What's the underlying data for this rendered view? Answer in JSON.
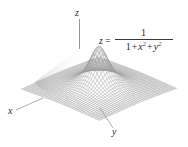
{
  "figure": {
    "name": "surface-plot-figure",
    "background_color": "#ffffff",
    "mesh_color": "#9a9a9a",
    "mesh_shadow_color": "#6e6e6e",
    "axis_color": "#7a7a7a",
    "text_color": "#2b2b2b"
  },
  "axes": {
    "z_label": "z",
    "x_label": "x",
    "y_label": "y"
  },
  "equation": {
    "lhs": "z",
    "relation": "=",
    "numerator": "1",
    "denominator_terms": [
      "1",
      "+",
      "x",
      "2",
      "+",
      "y",
      "2"
    ],
    "denominator_plain": "1 + x² + y²",
    "full_text": "z = 1 / (1 + x² + y²)"
  },
  "chart_data": {
    "type": "surface",
    "title": "",
    "function": "z = 1/(1 + x^2 + y^2)",
    "xlabel": "x",
    "ylabel": "y",
    "zlabel": "z",
    "xlim": [
      -4,
      4
    ],
    "ylim": [
      -4,
      4
    ],
    "zlim": [
      0,
      1
    ],
    "grid": true,
    "mesh_resolution": 40,
    "peak": {
      "x": 0,
      "y": 0,
      "z": 1
    },
    "legend": "none",
    "projection": "3d-wireframe"
  }
}
